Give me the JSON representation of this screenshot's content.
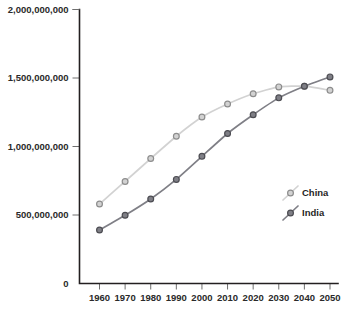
{
  "chart_data": {
    "type": "line",
    "title": "",
    "xlabel": "",
    "ylabel": "",
    "x": [
      1960,
      1970,
      1980,
      1990,
      2000,
      2010,
      2020,
      2030,
      2040,
      2050
    ],
    "xtick_labels": [
      "1960",
      "1970",
      "1980",
      "1990",
      "2000",
      "2010",
      "2020",
      "2030",
      "2040",
      "2050"
    ],
    "ylim": [
      0,
      2000000000
    ],
    "yticks": [
      0,
      500000000,
      1000000000,
      1500000000,
      2000000000
    ],
    "ytick_labels": [
      "0",
      "500,000,000",
      "1,000,000,000",
      "1,500,000,000",
      "2,000,000,000"
    ],
    "grid": false,
    "legend_position": "lower-right",
    "markers": "circle",
    "series": [
      {
        "name": "China",
        "color": "#d2d2d2",
        "marker_edge_color": "#8d8d8d",
        "values": [
          580000000,
          745000000,
          912000000,
          1075000000,
          1215000000,
          1310000000,
          1385000000,
          1435000000,
          1440000000,
          1410000000
        ]
      },
      {
        "name": "India",
        "color": "#7f7f86",
        "marker_edge_color": "#4c4c52",
        "values": [
          390000000,
          498000000,
          617000000,
          760000000,
          928000000,
          1095000000,
          1232000000,
          1355000000,
          1440000000,
          1508000000
        ]
      }
    ]
  },
  "legend": {
    "items": [
      {
        "label": "China"
      },
      {
        "label": "India"
      }
    ]
  },
  "axes": {
    "y_axis_name": "population-axis",
    "x_axis_name": "year-axis"
  }
}
